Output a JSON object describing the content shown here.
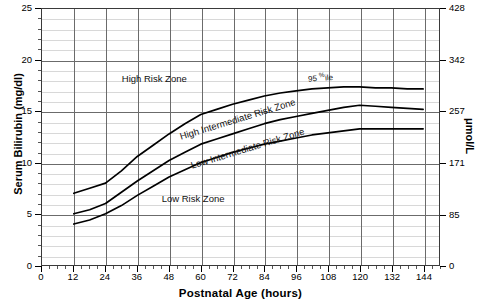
{
  "chart_data": {
    "type": "line",
    "title": "",
    "xlabel": "Postnatal Age (hours)",
    "ylabel": "Serum Bilirubin (mg/dl)",
    "ylabel_secondary": "μmol/L",
    "xlim": [
      0,
      150
    ],
    "ylim": [
      0,
      25
    ],
    "ylim_secondary": [
      0,
      428
    ],
    "xticks": [
      0,
      12,
      24,
      36,
      48,
      60,
      72,
      84,
      96,
      108,
      120,
      132,
      144
    ],
    "xticklabels": [
      "0",
      "12",
      "24",
      "36",
      "48",
      "60",
      "72",
      "84",
      "96",
      "108",
      "120",
      "132",
      "144"
    ],
    "yticks": [
      0,
      5,
      10,
      15,
      20,
      25
    ],
    "yticklabels": [
      "0",
      "5",
      "10",
      "15",
      "20",
      "25"
    ],
    "yticks_secondary": [
      0,
      85,
      171,
      257,
      342,
      428
    ],
    "yticklabels_secondary": [
      "0",
      "85",
      "171",
      "257",
      "342",
      "428"
    ],
    "grid": true,
    "grid_minor_y_step": 1,
    "grid_major_y_step": 5,
    "grid_major_x_step": 12,
    "legend": "none",
    "line_color": "#000000",
    "x": [
      12,
      18,
      24,
      30,
      36,
      42,
      48,
      54,
      60,
      66,
      72,
      78,
      84,
      90,
      96,
      102,
      108,
      114,
      120,
      126,
      132,
      138,
      144
    ],
    "series": [
      {
        "name": "95th percentile",
        "values": [
          7.0,
          7.5,
          8.0,
          9.2,
          10.6,
          11.7,
          12.8,
          13.8,
          14.7,
          15.2,
          15.7,
          16.1,
          16.5,
          16.8,
          17.0,
          17.2,
          17.3,
          17.4,
          17.4,
          17.3,
          17.3,
          17.2,
          17.2
        ]
      },
      {
        "name": "75th percentile",
        "values": [
          5.0,
          5.4,
          6.0,
          7.1,
          8.2,
          9.2,
          10.2,
          11.0,
          11.8,
          12.3,
          12.8,
          13.3,
          13.8,
          14.2,
          14.5,
          14.8,
          15.1,
          15.4,
          15.6,
          15.5,
          15.4,
          15.3,
          15.2
        ]
      },
      {
        "name": "40th percentile",
        "values": [
          4.0,
          4.4,
          5.0,
          5.8,
          6.8,
          7.7,
          8.6,
          9.3,
          10.0,
          10.5,
          11.0,
          11.4,
          11.8,
          12.1,
          12.4,
          12.7,
          12.9,
          13.1,
          13.3,
          13.3,
          13.3,
          13.3,
          13.3
        ]
      }
    ],
    "annotations": [
      {
        "name": "high-risk-zone",
        "text": "High Risk Zone",
        "x": 30,
        "y": 18.2,
        "rotation": 0
      },
      {
        "name": "high-intermediate-risk-zone",
        "text": "High Intermediate Risk Zone",
        "x": 52,
        "y": 12.6,
        "rotation": -17
      },
      {
        "name": "low-intermediate-risk-zone",
        "text": "Low Intermediate Risk Zone",
        "x": 56,
        "y": 9.8,
        "rotation": -17
      },
      {
        "name": "low-risk-zone",
        "text": "Low Risk Zone",
        "x": 45,
        "y": 6.6,
        "rotation": 0
      },
      {
        "name": "percentile-label",
        "text": "95 %ile",
        "x": 100,
        "y": 18.3,
        "rotation": -4
      }
    ]
  },
  "axes": {
    "x_title": "Postnatal Age (hours)",
    "y_title_left": "Serum Bilirubin (mg/dl)",
    "y_title_right": "μmol/L"
  },
  "annotation_text": {
    "high_risk": "High Risk Zone",
    "high_intermediate": "High Intermediate Risk Zone",
    "low_intermediate": "Low Intermediate Risk Zone",
    "low_risk": "Low Risk Zone",
    "percentile_prefix": "95 ",
    "percentile_sup": "%",
    "percentile_suffix": "ile"
  }
}
